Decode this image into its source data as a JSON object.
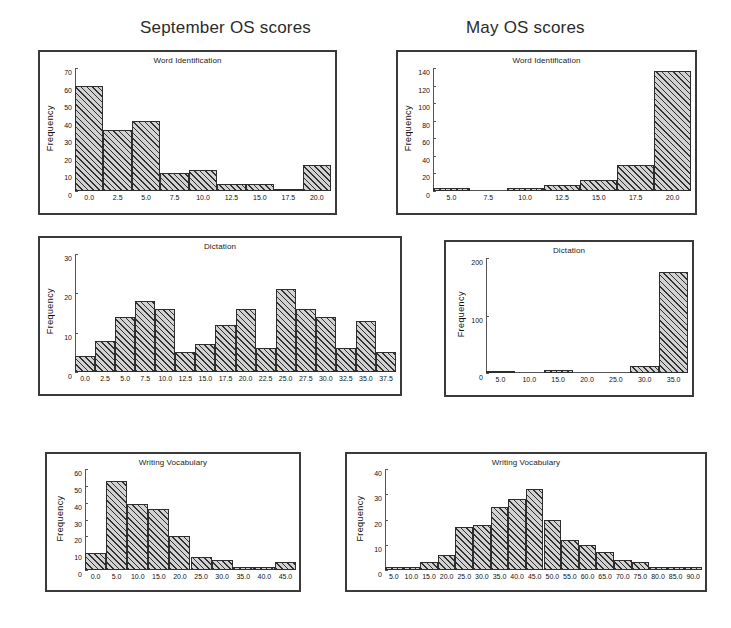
{
  "columns": {
    "september_title": "September OS scores",
    "may_title": "May OS scores"
  },
  "axis_label": "Frequency",
  "panels": {
    "sep_word": {
      "title": "Word Identification"
    },
    "may_word": {
      "title": "Word Identification"
    },
    "sep_dict": {
      "title": "Dictation"
    },
    "may_dict": {
      "title": "Dictation"
    },
    "sep_vocab": {
      "title": "Writing Vocabulary"
    },
    "may_vocab": {
      "title": "Writing Vocabulary"
    }
  },
  "chart_data": [
    {
      "id": "sep_word",
      "type": "bar",
      "title": "Word Identification",
      "group": "September OS scores",
      "xlabel": "",
      "ylabel": "Frequency",
      "ylim": [
        0,
        70
      ],
      "yticks": [
        0,
        10,
        20,
        30,
        40,
        50,
        60,
        70
      ],
      "xlim": [
        -1.25,
        21.25
      ],
      "xticks": [
        0.0,
        2.5,
        5.0,
        7.5,
        10.0,
        12.5,
        15.0,
        17.5,
        20.0
      ],
      "xticklabels": [
        "0.0",
        "2.5",
        "5.0",
        "7.5",
        "10.0",
        "12.5",
        "15.0",
        "17.5",
        "20.0"
      ],
      "bin_width": 2.5,
      "bin_centers": [
        0.0,
        2.5,
        5.0,
        7.5,
        10.0,
        12.5,
        15.0,
        17.5,
        20.0
      ],
      "values": [
        60,
        35,
        40,
        10,
        12,
        4,
        4,
        1,
        15
      ],
      "grid": false,
      "legend": "none"
    },
    {
      "id": "may_word",
      "type": "bar",
      "title": "Word Identification",
      "group": "May OS scores",
      "xlabel": "",
      "ylabel": "Frequency",
      "ylim": [
        0,
        140
      ],
      "yticks": [
        0,
        20,
        40,
        60,
        80,
        100,
        120,
        140
      ],
      "xlim": [
        3.75,
        21.25
      ],
      "xticks": [
        5.0,
        7.5,
        10.0,
        12.5,
        15.0,
        17.5,
        20.0
      ],
      "xticklabels": [
        "5.0",
        "7.5",
        "10.0",
        "12.5",
        "15.0",
        "17.5",
        "20.0"
      ],
      "bin_width": 2.5,
      "bin_centers": [
        5.0,
        7.5,
        10.0,
        12.5,
        15.0,
        17.5,
        20.0
      ],
      "values": [
        3,
        0,
        4,
        7,
        12,
        30,
        137
      ],
      "grid": false,
      "legend": "none"
    },
    {
      "id": "sep_dict",
      "type": "bar",
      "title": "Dictation",
      "group": "September OS scores",
      "xlabel": "",
      "ylabel": "Frequency",
      "ylim": [
        0,
        30
      ],
      "yticks": [
        0,
        10,
        20,
        30
      ],
      "xlim": [
        -1.25,
        38.75
      ],
      "xticks": [
        0.0,
        2.5,
        5.0,
        7.5,
        10.0,
        12.5,
        15.0,
        17.5,
        20.0,
        22.5,
        25.0,
        27.5,
        30.0,
        32.5,
        35.0,
        37.5
      ],
      "xticklabels": [
        "0.0",
        "2.5",
        "5.0",
        "7.5",
        "10.0",
        "12.5",
        "15.0",
        "17.5",
        "20.0",
        "22.5",
        "25.0",
        "27.5",
        "30.0",
        "32.5",
        "35.0",
        "37.5"
      ],
      "bin_width": 2.5,
      "bin_centers": [
        0.0,
        2.5,
        5.0,
        7.5,
        10.0,
        12.5,
        15.0,
        17.5,
        20.0,
        22.5,
        25.0,
        27.5,
        30.0,
        32.5,
        35.0,
        37.5
      ],
      "values": [
        4,
        8,
        14,
        18,
        16,
        5,
        7,
        12,
        16,
        6,
        21,
        16,
        14,
        6,
        13,
        5
      ],
      "grid": false,
      "legend": "none"
    },
    {
      "id": "may_dict",
      "type": "bar",
      "title": "Dictation",
      "group": "May OS scores",
      "xlabel": "",
      "ylabel": "Frequency",
      "ylim": [
        0,
        200
      ],
      "yticks": [
        0,
        100,
        200
      ],
      "xlim": [
        2.5,
        37.5
      ],
      "xticks": [
        5.0,
        10.0,
        15.0,
        20.0,
        25.0,
        30.0,
        35.0
      ],
      "xticklabels": [
        "5.0",
        "10.0",
        "15.0",
        "20.0",
        "25.0",
        "30.0",
        "35.0"
      ],
      "bin_width": 5.0,
      "bin_centers": [
        5.0,
        10.0,
        15.0,
        20.0,
        25.0,
        30.0,
        35.0
      ],
      "values": [
        2,
        0,
        5,
        0,
        0,
        12,
        175
      ],
      "grid": false,
      "legend": "none"
    },
    {
      "id": "sep_vocab",
      "type": "bar",
      "title": "Writing Vocabulary",
      "group": "September OS scores",
      "xlabel": "",
      "ylabel": "Frequency",
      "ylim": [
        0,
        60
      ],
      "yticks": [
        0,
        10,
        20,
        30,
        40,
        50,
        60
      ],
      "xlim": [
        -2.5,
        47.5
      ],
      "xticks": [
        0.0,
        5.0,
        10.0,
        15.0,
        20.0,
        25.0,
        30.0,
        35.0,
        40.0,
        45.0
      ],
      "xticklabels": [
        "0.0",
        "5.0",
        "10.0",
        "15.0",
        "20.0",
        "25.0",
        "30.0",
        "35.0",
        "40.0",
        "45.0"
      ],
      "bin_width": 5.0,
      "bin_centers": [
        0.0,
        5.0,
        10.0,
        15.0,
        20.0,
        25.0,
        30.0,
        35.0,
        40.0,
        45.0
      ],
      "values": [
        10,
        53,
        39,
        36,
        20,
        8,
        6,
        2,
        2,
        5
      ],
      "grid": false,
      "legend": "none"
    },
    {
      "id": "may_vocab",
      "type": "bar",
      "title": "Writing Vocabulary",
      "group": "May OS scores",
      "xlabel": "",
      "ylabel": "Frequency",
      "ylim": [
        0,
        40
      ],
      "yticks": [
        0,
        10,
        20,
        30,
        40
      ],
      "xlim": [
        2.5,
        92.5
      ],
      "xticks": [
        5.0,
        10.0,
        15.0,
        20.0,
        25.0,
        30.0,
        35.0,
        40.0,
        45.0,
        50.0,
        55.0,
        60.0,
        65.0,
        70.0,
        75.0,
        80.0,
        85.0,
        90.0
      ],
      "xticklabels": [
        "5.0",
        "10.0",
        "15.0",
        "20.0",
        "25.0",
        "30.0",
        "35.0",
        "40.0",
        "45.0",
        "50.0",
        "55.0",
        "60.0",
        "65.0",
        "70.0",
        "75.0",
        "80.0",
        "85.0",
        "90.0"
      ],
      "bin_width": 5.0,
      "bin_centers": [
        5.0,
        10.0,
        15.0,
        20.0,
        25.0,
        30.0,
        35.0,
        40.0,
        45.0,
        50.0,
        55.0,
        60.0,
        65.0,
        70.0,
        75.0,
        80.0,
        85.0,
        90.0
      ],
      "values": [
        1,
        1,
        3,
        6,
        17,
        18,
        25,
        28,
        32,
        20,
        12,
        10,
        7,
        4,
        3,
        1,
        1,
        1
      ],
      "grid": false,
      "legend": "none"
    }
  ]
}
